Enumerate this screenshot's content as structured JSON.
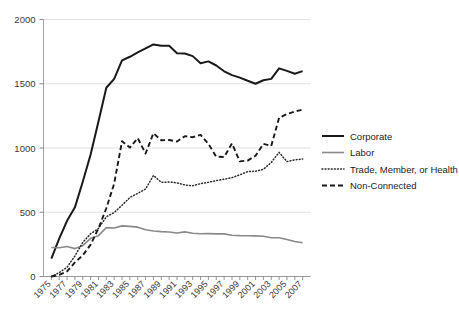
{
  "chart_data": {
    "type": "line",
    "title": "",
    "subtitle": "",
    "xlabel": "",
    "ylabel": "",
    "xlim": [
      1974,
      2008
    ],
    "ylim": [
      0,
      2000
    ],
    "grid": "horizontal",
    "legend_position": "right",
    "y_ticks": [
      "0",
      "500",
      "1000",
      "1500",
      "2000"
    ],
    "y_tick_values": [
      0,
      500,
      1000,
      1500,
      2000
    ],
    "x_ticks": [
      "1975",
      "1977",
      "1979",
      "1981",
      "1983",
      "1985",
      "1987",
      "1989",
      "1991",
      "1993",
      "1995",
      "1997",
      "1999",
      "2001",
      "2003",
      "2005",
      "2007"
    ],
    "x_tick_values": [
      1975,
      1977,
      1979,
      1981,
      1983,
      1985,
      1987,
      1989,
      1991,
      1993,
      1995,
      1997,
      1999,
      2001,
      2003,
      2005,
      2007
    ],
    "x": [
      1975,
      1976,
      1977,
      1978,
      1979,
      1980,
      1981,
      1982,
      1983,
      1984,
      1985,
      1986,
      1987,
      1988,
      1989,
      1990,
      1991,
      1992,
      1993,
      1994,
      1995,
      1996,
      1997,
      1998,
      1999,
      2000,
      2001,
      2002,
      2003,
      2004,
      2005,
      2006,
      2007
    ],
    "series": [
      {
        "name": "Corporate",
        "style": "solid",
        "color": "#1a1a1a",
        "width": 2.0,
        "values": [
          139,
          294,
          433,
          538,
          738,
          949,
          1206,
          1469,
          1538,
          1682,
          1710,
          1744,
          1775,
          1806,
          1796,
          1795,
          1738,
          1735,
          1715,
          1660,
          1674,
          1642,
          1597,
          1567,
          1548,
          1523,
          1500,
          1527,
          1538,
          1620,
          1600,
          1578,
          1598
        ]
      },
      {
        "name": "Labor",
        "style": "solid",
        "color": "#8a8a8a",
        "width": 1.6,
        "values": [
          226,
          224,
          234,
          217,
          240,
          297,
          318,
          380,
          378,
          394,
          390,
          384,
          364,
          354,
          349,
          346,
          338,
          347,
          337,
          333,
          334,
          332,
          332,
          321,
          318,
          317,
          316,
          313,
          302,
          302,
          288,
          273,
          263
        ]
      },
      {
        "name": "Trade, Member, or Health",
        "style": "dotted",
        "color": "#2b2b2b",
        "width": 1.5,
        "values": [
          0,
          30,
          72,
          160,
          265,
          333,
          374,
          464,
          498,
          554,
          615,
          647,
          681,
          786,
          733,
          735,
          729,
          712,
          706,
          723,
          733,
          746,
          757,
          769,
          791,
          816,
          819,
          834,
          888,
          966,
          894,
          908,
          914
        ]
      },
      {
        "name": "Non-Connected",
        "style": "dashed",
        "color": "#1a1a1a",
        "width": 1.9,
        "values": [
          0,
          12,
          40,
          110,
          165,
          248,
          374,
          531,
          723,
          1053,
          1003,
          1077,
          957,
          1115,
          1060,
          1062,
          1050,
          1092,
          1084,
          1102,
          1031,
          933,
          930,
          1035,
          896,
          902,
          940,
          1032,
          1016,
          1234,
          1264,
          1284,
          1299
        ]
      }
    ]
  },
  "legend": {
    "items": [
      {
        "label": "Corporate"
      },
      {
        "label": "Labor"
      },
      {
        "label": "Trade, Member, or Health"
      },
      {
        "label": "Non-Connected"
      }
    ]
  }
}
